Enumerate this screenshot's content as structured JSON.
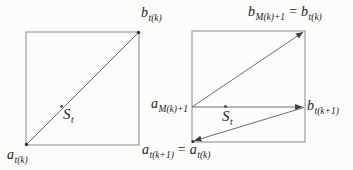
{
  "colors": {
    "background": "#fcfcfa",
    "line": "#6d6d6d",
    "square_edge": "#8a8a8a",
    "text": "#1c1c1c"
  },
  "figures": {
    "left": {
      "corner_top_right": {
        "main": "b",
        "sub": "t(k)"
      },
      "corner_bottom_left": {
        "main": "a",
        "sub": "t(k)"
      },
      "point_s": {
        "main": "S",
        "sub": "t"
      }
    },
    "right": {
      "corner_top_right": {
        "parts": [
          {
            "main": "b",
            "sub": "M(k)+1"
          },
          {
            "main": "= b",
            "sub": "t(k)"
          }
        ]
      },
      "mid_left": {
        "main": "a",
        "sub": "M(k)+1"
      },
      "mid_right": {
        "main": "b",
        "sub": "t(k+1)"
      },
      "corner_bottom_left": {
        "parts": [
          {
            "main": "a",
            "sub": "t(k+1)"
          },
          {
            "main": "= a",
            "sub": "t(k)"
          }
        ]
      },
      "point_s": {
        "main": "S",
        "sub": "t"
      }
    }
  }
}
